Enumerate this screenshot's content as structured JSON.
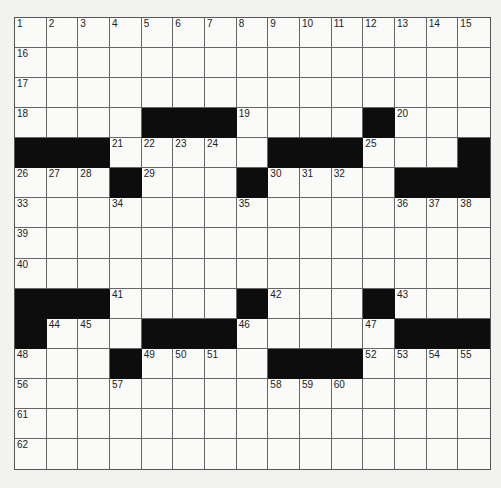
{
  "puzzle": {
    "rows": 15,
    "cols": 15,
    "layout": [
      "...............",
      "...............",
      "...............",
      "....###....#...",
      "###.....###...#",
      "...#...#....###",
      "...............",
      "...............",
      "...............",
      "###....#...#...",
      "#...###.....###",
      "...#....###....",
      "...............",
      "...............",
      "..............."
    ],
    "numbers": [
      {
        "r": 0,
        "c": 0,
        "n": "1"
      },
      {
        "r": 0,
        "c": 1,
        "n": "2"
      },
      {
        "r": 0,
        "c": 2,
        "n": "3"
      },
      {
        "r": 0,
        "c": 3,
        "n": "4"
      },
      {
        "r": 0,
        "c": 4,
        "n": "5"
      },
      {
        "r": 0,
        "c": 5,
        "n": "6"
      },
      {
        "r": 0,
        "c": 6,
        "n": "7"
      },
      {
        "r": 0,
        "c": 7,
        "n": "8"
      },
      {
        "r": 0,
        "c": 8,
        "n": "9"
      },
      {
        "r": 0,
        "c": 9,
        "n": "10"
      },
      {
        "r": 0,
        "c": 10,
        "n": "11"
      },
      {
        "r": 0,
        "c": 11,
        "n": "12"
      },
      {
        "r": 0,
        "c": 12,
        "n": "13"
      },
      {
        "r": 0,
        "c": 13,
        "n": "14"
      },
      {
        "r": 0,
        "c": 14,
        "n": "15"
      },
      {
        "r": 1,
        "c": 0,
        "n": "16"
      },
      {
        "r": 2,
        "c": 0,
        "n": "17"
      },
      {
        "r": 3,
        "c": 0,
        "n": "18"
      },
      {
        "r": 3,
        "c": 7,
        "n": "19"
      },
      {
        "r": 3,
        "c": 12,
        "n": "20"
      },
      {
        "r": 4,
        "c": 3,
        "n": "21"
      },
      {
        "r": 4,
        "c": 4,
        "n": "22"
      },
      {
        "r": 4,
        "c": 5,
        "n": "23"
      },
      {
        "r": 4,
        "c": 6,
        "n": "24"
      },
      {
        "r": 4,
        "c": 11,
        "n": "25"
      },
      {
        "r": 5,
        "c": 0,
        "n": "26"
      },
      {
        "r": 5,
        "c": 1,
        "n": "27"
      },
      {
        "r": 5,
        "c": 2,
        "n": "28"
      },
      {
        "r": 5,
        "c": 4,
        "n": "29"
      },
      {
        "r": 5,
        "c": 8,
        "n": "30"
      },
      {
        "r": 5,
        "c": 9,
        "n": "31"
      },
      {
        "r": 5,
        "c": 10,
        "n": "32"
      },
      {
        "r": 6,
        "c": 0,
        "n": "33"
      },
      {
        "r": 6,
        "c": 3,
        "n": "34"
      },
      {
        "r": 6,
        "c": 7,
        "n": "35"
      },
      {
        "r": 6,
        "c": 12,
        "n": "36"
      },
      {
        "r": 6,
        "c": 13,
        "n": "37"
      },
      {
        "r": 6,
        "c": 14,
        "n": "38"
      },
      {
        "r": 7,
        "c": 0,
        "n": "39"
      },
      {
        "r": 8,
        "c": 0,
        "n": "40"
      },
      {
        "r": 9,
        "c": 3,
        "n": "41"
      },
      {
        "r": 9,
        "c": 8,
        "n": "42"
      },
      {
        "r": 9,
        "c": 12,
        "n": "43"
      },
      {
        "r": 10,
        "c": 1,
        "n": "44"
      },
      {
        "r": 10,
        "c": 2,
        "n": "45"
      },
      {
        "r": 10,
        "c": 7,
        "n": "46"
      },
      {
        "r": 10,
        "c": 11,
        "n": "47"
      },
      {
        "r": 11,
        "c": 0,
        "n": "48"
      },
      {
        "r": 11,
        "c": 4,
        "n": "49"
      },
      {
        "r": 11,
        "c": 5,
        "n": "50"
      },
      {
        "r": 11,
        "c": 6,
        "n": "51"
      },
      {
        "r": 11,
        "c": 11,
        "n": "52"
      },
      {
        "r": 11,
        "c": 12,
        "n": "53"
      },
      {
        "r": 11,
        "c": 13,
        "n": "54"
      },
      {
        "r": 11,
        "c": 14,
        "n": "55"
      },
      {
        "r": 12,
        "c": 0,
        "n": "56"
      },
      {
        "r": 12,
        "c": 3,
        "n": "57"
      },
      {
        "r": 12,
        "c": 8,
        "n": "58"
      },
      {
        "r": 12,
        "c": 9,
        "n": "59"
      },
      {
        "r": 12,
        "c": 10,
        "n": "60"
      },
      {
        "r": 13,
        "c": 0,
        "n": "61"
      },
      {
        "r": 14,
        "c": 0,
        "n": "62"
      }
    ],
    "colors": {
      "black_square": "#0d0d0d",
      "white_square": "#fafaf8",
      "grid_line": "#666666",
      "background": "#f2f2f0"
    }
  }
}
